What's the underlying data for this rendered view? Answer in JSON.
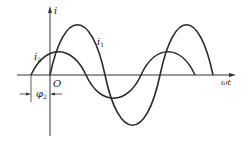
{
  "diagram": {
    "type": "phase-shift-waveforms",
    "axes": {
      "y_label": "i",
      "x_label": "ωt",
      "origin_label": "O"
    },
    "curves": [
      {
        "name": "i1",
        "label_main": "i",
        "label_sub": "1",
        "amplitude_px": 50,
        "phase": "0",
        "color": "#2a2a2a"
      },
      {
        "name": "i2",
        "label_main": "i",
        "label_sub": "2",
        "amplitude_px": 23,
        "phase": "leads by φ2",
        "color": "#2a2a2a"
      }
    ],
    "phase_annotation": {
      "main": "φ",
      "sub": "2"
    },
    "colors": {
      "line": "#2a2a2a",
      "axis": "#333333",
      "background": "#ffffff"
    }
  }
}
